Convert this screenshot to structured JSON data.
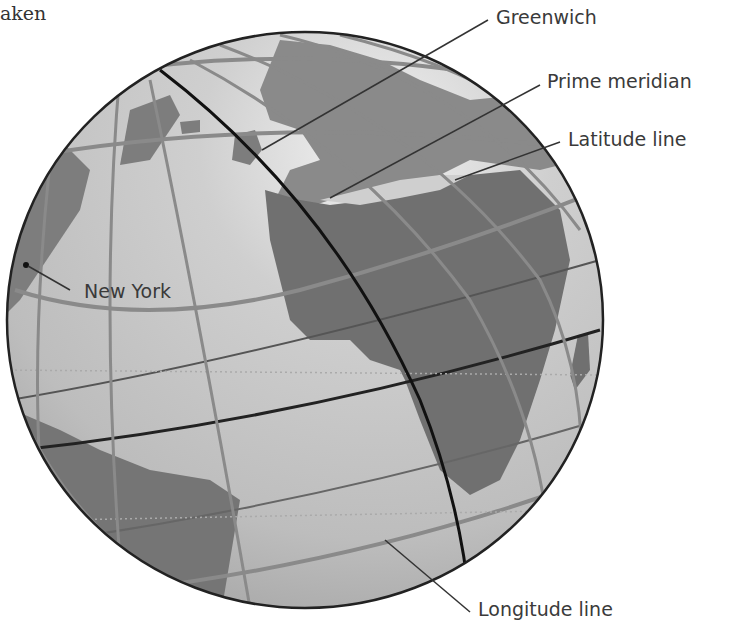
{
  "caption_fragment": "aken",
  "figure": {
    "labels": {
      "greenwich": "Greenwich",
      "prime_meridian": "Prime meridian",
      "latitude_line": "Latitude line",
      "new_york": "New York",
      "longitude_line": "Longitude line"
    }
  },
  "colors": {
    "ocean": "#c4c4c4",
    "land": "#7a7a7a",
    "outline": "#222222",
    "grid": "#8a8a8a",
    "leader": "#333333"
  }
}
